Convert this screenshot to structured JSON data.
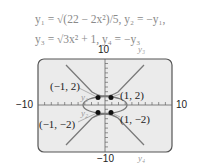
{
  "equations": {
    "line1": "y₁ = √(22 − 2x²)/5,  y₂ = −y₁,",
    "line2": "y₃ = √3x² + 1,  y₄ = −y₃"
  },
  "axes": {
    "y_max": "10",
    "y_min": "−10",
    "x_min": "−10",
    "x_max": "10"
  },
  "curve_labels": {
    "y1": "y₁",
    "y2": "y₂",
    "y3": "y₃",
    "y4": "y₄"
  },
  "points": [
    {
      "label": "(−1, 2)"
    },
    {
      "label": "(1, 2)"
    },
    {
      "label": "(−1, −2)"
    },
    {
      "label": "(1, −2)"
    }
  ],
  "colors": {
    "frame_bg": "#ebebeb",
    "frame_border": "#555555",
    "curve": "#7a7a7a",
    "point": "#111111"
  }
}
